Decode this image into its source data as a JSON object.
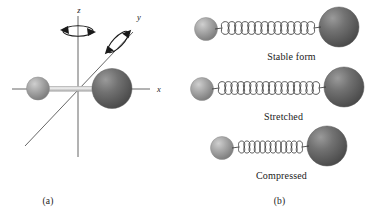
{
  "figure": {
    "panels": [
      {
        "id": "a",
        "caption": "(a)",
        "kind": "axes-molecule",
        "axes": [
          {
            "name": "x",
            "label": "x",
            "orientation": "horizontal-right"
          },
          {
            "name": "y",
            "label": "y",
            "orientation": "diagonal-upper-right"
          },
          {
            "name": "z",
            "label": "z",
            "orientation": "vertical-up"
          }
        ],
        "rotation_arrows": [
          {
            "about_axis": "z",
            "style": "curved-double-arrow"
          },
          {
            "about_axis": "y",
            "style": "curved-double-arrow"
          }
        ],
        "atoms": [
          {
            "name": "small-atom",
            "size": "small",
            "color": "#a3a3a3",
            "position": "left"
          },
          {
            "name": "large-atom",
            "size": "large",
            "color": "#6e6e6e",
            "position": "right"
          }
        ],
        "bond": {
          "name": "rigid-rod",
          "color": "#b0b0b0"
        }
      },
      {
        "id": "b",
        "caption": "(b)",
        "kind": "spring-states",
        "states": [
          {
            "name": "stable",
            "label": "Stable form",
            "coils": 14,
            "spring_length": 104,
            "coil_width": 7.4
          },
          {
            "name": "stretched",
            "label": "Stretched",
            "coils": 16,
            "spring_length": 120,
            "coil_width": 7.5
          },
          {
            "name": "compressed",
            "label": "Compressed",
            "coils": 12,
            "spring_length": 70,
            "coil_width": 5.8
          }
        ],
        "atoms": [
          {
            "name": "small-atom",
            "size": "small",
            "color": "#a3a3a3"
          },
          {
            "name": "large-atom",
            "size": "large",
            "color": "#6e6e6e"
          }
        ]
      }
    ]
  },
  "colors": {
    "background": "#ffffff",
    "ink": "#1a1a1a",
    "axis_line": "#555555",
    "rod": "#b0b0b0",
    "atom_small": "#a3a3a3",
    "atom_large": "#6e6e6e",
    "spring": "#3a3a3a"
  }
}
